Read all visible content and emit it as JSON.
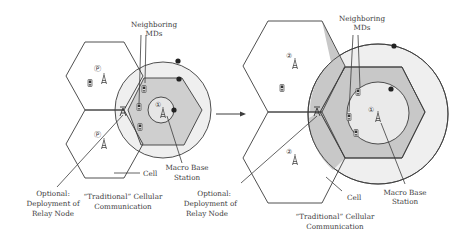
{
  "diagram": {
    "type": "cellular-network-relay-comparison",
    "colors": {
      "line": "#3c3c3c",
      "outer_ring_fill": "#efefef",
      "hex_fill_left": "#cfcfcf",
      "hex_fill_right": "#c8c8c8",
      "dot": "#222222",
      "text": "#3a3a3a"
    },
    "left_panel": {
      "labels": {
        "neighboring_mds_line1": "Neighboring",
        "neighboring_mds_line2": "MDs",
        "macro_line1": "Macro Base",
        "macro_line2": "Station",
        "cell": "Cell",
        "relay_line1": "Optional:",
        "relay_line2": "Deployment of",
        "relay_line3": "Relay Node",
        "traditional_line1": "“Traditional” Cellular",
        "traditional_line2": "Communication"
      },
      "markers": {
        "dot1": "1",
        "dot2": "2",
        "dot3": "3"
      }
    },
    "arrow": {
      "direction": "right"
    },
    "right_panel": {
      "labels": {
        "neighboring_mds_line1": "Neighboring",
        "neighboring_mds_line2": "MDs",
        "macro_line1": "Macro Base",
        "macro_line2": "Station",
        "cell": "Cell",
        "relay_line1": "Optional:",
        "relay_line2": "Deployment of",
        "relay_line3": "Relay Node",
        "traditional_line1": "“Traditional” Cellular",
        "traditional_line2": "Communication"
      },
      "markers": {
        "dot1": "1",
        "dot2": "2"
      }
    }
  }
}
